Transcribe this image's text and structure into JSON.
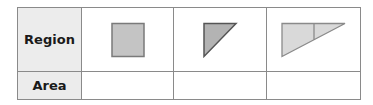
{
  "table": {
    "row_headers": [
      "Region",
      "Area"
    ],
    "regions": [
      {
        "shape": "square",
        "fill": "#c4c4c4",
        "stroke": "#7a7a7a"
      },
      {
        "shape": "right-triangle",
        "fill": "#b3b3b3",
        "stroke": "#555555"
      },
      {
        "shape": "right-triangle-split",
        "fill": "#d9d9d9",
        "stroke": "#8a8a8a"
      }
    ],
    "areas": [
      "",
      "",
      ""
    ]
  }
}
